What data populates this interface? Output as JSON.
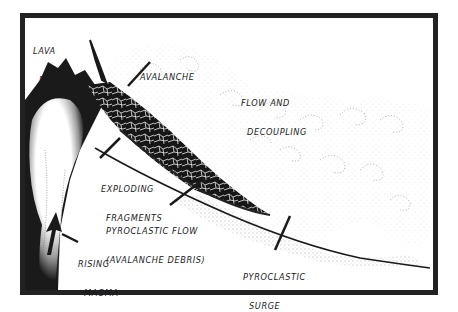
{
  "diagram": {
    "type": "illustration",
    "colors": {
      "ink": "#1a1a1a",
      "background": "#ffffff",
      "frame": "#222222"
    },
    "labels": {
      "lava_dome": [
        "LAVA",
        "DOME"
      ],
      "avalanche": "AVALANCHE",
      "flow_and_decoupling": [
        "FLOW AND",
        "DECOUPLING"
      ],
      "exploding_fragments": [
        "EXPLODING",
        "FRAGMENTS"
      ],
      "pyroclastic_flow": [
        "PYROCLASTIC FLOW",
        "(AVALANCHE DEBRIS)"
      ],
      "rising_magma": [
        "RISING",
        "MAGMA"
      ],
      "pyroclastic_surge": [
        "PYROCLASTIC",
        "SURGE"
      ]
    }
  }
}
